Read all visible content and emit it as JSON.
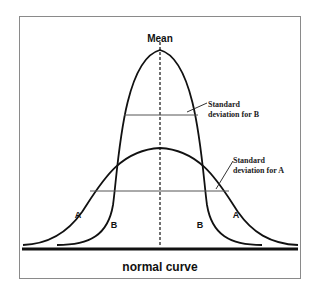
{
  "diagram": {
    "title": "normal curve",
    "mean_label": "Mean",
    "annotations": {
      "sd_b_line1": "Standard",
      "sd_b_line2": "deviation for B",
      "sd_a_line1": "Standard",
      "sd_a_line2": "deviation for A"
    },
    "curve_labels": {
      "a_left": "A",
      "b_left": "B",
      "b_right": "B",
      "a_right": "A"
    },
    "curves": [
      {
        "name": "A",
        "description": "wide, flat normal curve",
        "peak_y": 148
      },
      {
        "name": "B",
        "description": "narrow, tall normal curve",
        "peak_y": 50
      }
    ],
    "colors": {
      "curve": "#111111",
      "sd_line": "#555555",
      "frame": "#8a8a8a",
      "baseline": "#111111"
    }
  }
}
